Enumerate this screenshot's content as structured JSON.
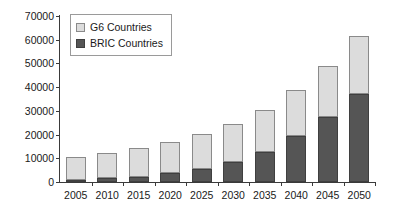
{
  "chart_data": {
    "type": "bar",
    "subtype": "stacked-vertical-bar",
    "title": "",
    "subtitle": "",
    "xlabel": "",
    "ylabel": "",
    "categories": [
      "2005",
      "2010",
      "2015",
      "2020",
      "2025",
      "2030",
      "2035",
      "2040",
      "2045",
      "2050"
    ],
    "series": [
      {
        "name": "BRIC Countries",
        "color": "#555555",
        "stack_order": 0,
        "values": [
          800,
          1500,
          2300,
          3600,
          5600,
          8400,
          12700,
          19300,
          27200,
          37000
        ]
      },
      {
        "name": "G6 Countries",
        "color": "#dcdcdc",
        "stack_order": 1,
        "values": [
          9900,
          10900,
          12100,
          13300,
          14600,
          16100,
          17700,
          19500,
          21800,
          24500
        ]
      }
    ],
    "totals": [
      10700,
      12400,
      14400,
      16900,
      20200,
      24500,
      30400,
      38800,
      49000,
      61500
    ],
    "ylim": [
      0,
      70000
    ],
    "ytick_step": 10000,
    "yticks": [
      "0",
      "10000",
      "20000",
      "30000",
      "40000",
      "50000",
      "60000",
      "70000"
    ],
    "ytick_values": [
      0,
      10000,
      20000,
      30000,
      40000,
      50000,
      60000,
      70000
    ],
    "grid": false,
    "legend_position": "top-left"
  },
  "legend": {
    "entries": [
      {
        "label": "G6 Countries",
        "swatch": "legend-swatch-g6"
      },
      {
        "label": "BRIC Countries",
        "swatch": "legend-swatch-bric"
      }
    ]
  },
  "colors": {
    "g6_fill": "#dcdcdc",
    "bric_fill": "#555555",
    "axis": "#3a3a3a",
    "background": "#ffffff",
    "text": "#1a1a1a"
  }
}
